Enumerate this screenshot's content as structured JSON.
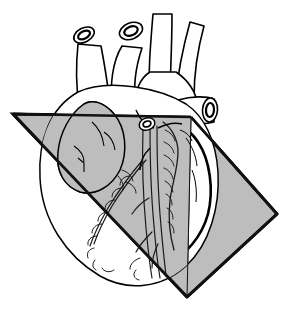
{
  "figure": {
    "view": "anterior",
    "caption": "",
    "background_color": "#ffffff",
    "outline_color": "#000000",
    "plane_fill_color": "#bdbdbd",
    "plane_edge_color": "#111111",
    "organ_fill_color": "#ffffff",
    "organ_shaded_color": "#bdbdbd",
    "vessel_line_color": "#1a1a1a"
  },
  "plane": {
    "label": "oblique sectioning plane",
    "shape": "quadrilateral",
    "fill": "#bdbdbd",
    "stroke": "#111111",
    "stroke_width": "3",
    "corners": {
      "left": "13,114",
      "top": "191,117",
      "right": "277,214",
      "bottom": "187,297"
    }
  },
  "structures": [
    {
      "id": "aortic-arch",
      "label": "Aortic arch"
    },
    {
      "id": "brachiocephalic-trunk",
      "label": "Brachiocephalic trunk"
    },
    {
      "id": "left-common-carotid-artery",
      "label": "Left common carotid artery"
    },
    {
      "id": "left-subclavian-artery",
      "label": "Left subclavian artery"
    },
    {
      "id": "superior-vena-cava",
      "label": "Superior vena cava"
    },
    {
      "id": "pulmonary-trunk",
      "label": "Pulmonary trunk"
    },
    {
      "id": "right-pulmonary-artery-stump",
      "label": "Right pulmonary artery (cut)"
    },
    {
      "id": "right-atrium",
      "label": "Right atrium"
    },
    {
      "id": "right-ventricle",
      "label": "Right ventricle"
    },
    {
      "id": "left-ventricle",
      "label": "Left ventricle"
    },
    {
      "id": "left-atrial-appendage",
      "label": "Left atrial appendage"
    },
    {
      "id": "anterior-interventricular-artery",
      "label": "Anterior interventricular (LAD) artery"
    },
    {
      "id": "great-cardiac-vein",
      "label": "Great cardiac vein"
    },
    {
      "id": "epicardial-fat",
      "label": "Epicardial fat"
    },
    {
      "id": "coronary-sulcus",
      "label": "Coronary sulcus"
    },
    {
      "id": "cardiac-apex",
      "label": "Cardiac apex"
    }
  ],
  "vessel_cut_ends": [
    {
      "id": "cut-end-left",
      "label": "cut vessel end (left)",
      "cx": 84,
      "cy": 35,
      "rx": 10,
      "ry": 6,
      "angle": -28
    },
    {
      "id": "cut-end-center",
      "label": "cut vessel end (center)",
      "cx": 131,
      "cy": 31,
      "rx": 11,
      "ry": 7,
      "angle": -22
    },
    {
      "id": "cut-end-pulmonary",
      "label": "cut end of right pulmonary artery",
      "cx": 207,
      "cy": 100,
      "rx": 8,
      "ry": 12,
      "angle": 6
    }
  ]
}
